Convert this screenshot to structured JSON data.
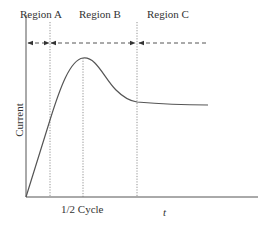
{
  "diagram": {
    "regions": [
      {
        "label": "Region A"
      },
      {
        "label": "Region B"
      },
      {
        "label": "Region C"
      }
    ],
    "y_axis_label": "Current",
    "x_axis_label": "t",
    "x_marker_label": "1/2 Cycle",
    "colors": {
      "line": "#555555",
      "guide": "#777777",
      "text": "#333333"
    }
  }
}
